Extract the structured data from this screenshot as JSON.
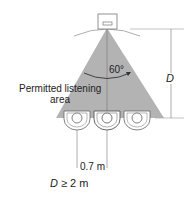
{
  "diagram": {
    "angle_label": "60°",
    "area_label_line1": "Permitted listening",
    "area_label_line2": "area",
    "distance_label": "D",
    "spacing_label": "0.7 m",
    "constraint_label_var": "D",
    "constraint_label_rest": " ≥ 2 m",
    "colors": {
      "cone": "#b3b3b3",
      "lines": "#888888",
      "text": "#222222"
    },
    "listeners": 3
  }
}
